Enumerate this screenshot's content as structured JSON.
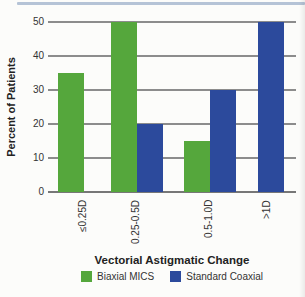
{
  "figure": {
    "top_rule_color": "#b5c3d6"
  },
  "chart_data": {
    "type": "bar",
    "title": "",
    "categories": [
      "≤0.25D",
      "0.25-0.5D",
      "0.5-1.0D",
      ">1D"
    ],
    "series": [
      {
        "name": "Biaxial MICS",
        "color": "#55a73c",
        "values": [
          35,
          50,
          15,
          0
        ]
      },
      {
        "name": "Standard Coaxial",
        "color": "#2c4a9c",
        "values": [
          0,
          20,
          30,
          50
        ]
      }
    ],
    "xlabel": "Vectorial Astigmatic Change",
    "ylabel": "Percent of Patients",
    "yticks": [
      0,
      10,
      20,
      30,
      40,
      50
    ],
    "ylim": [
      0,
      50
    ],
    "grid": true,
    "legend_position": "bottom"
  }
}
